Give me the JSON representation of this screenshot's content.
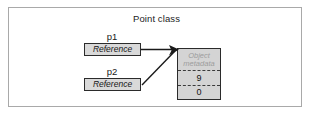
{
  "diagram": {
    "title": "Point class",
    "frame": {
      "border_color": "#a9a9a9"
    },
    "references": [
      {
        "name": "p1",
        "box_label": "Reference"
      },
      {
        "name": "p2",
        "box_label": "Reference"
      }
    ],
    "object": {
      "metadata_line1": "Object",
      "metadata_line2": "metadata",
      "metadata_color": "#9c9c9c",
      "fields": [
        {
          "value": "9"
        },
        {
          "value": "0"
        }
      ],
      "fill_color": "#d4d4d4",
      "border_color": "#2b2b2b"
    },
    "arrows": [
      {
        "from": "p1",
        "to": "object",
        "style": "solid-arrowhead"
      },
      {
        "from": "p2",
        "to": "object",
        "style": "solid-arrowhead"
      }
    ]
  }
}
